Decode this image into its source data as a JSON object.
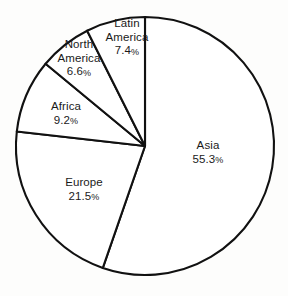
{
  "chart_data": {
    "type": "pie",
    "title": "",
    "subtitle": "",
    "xlabel": "",
    "ylabel": "",
    "legend": "none",
    "grid": false,
    "units": "percent",
    "start_angle_deg": 0,
    "direction": "clockwise",
    "categories": [
      "Asia",
      "Europe",
      "Africa",
      "North America",
      "Latin America"
    ],
    "values": [
      55.3,
      21.5,
      9.2,
      6.6,
      7.4
    ],
    "slices": [
      {
        "name": "Asia",
        "label": "Asia",
        "value": 55.3,
        "value_text": "55.3",
        "pct_symbol": "%",
        "start_deg": 0,
        "end_deg": 199.08,
        "label_x": 208,
        "label_y": 153
      },
      {
        "name": "Europe",
        "label": "Europe",
        "value": 21.5,
        "value_text": "21.5",
        "pct_symbol": "%",
        "start_deg": 199.08,
        "end_deg": 276.48,
        "label_x": 84,
        "label_y": 190
      },
      {
        "name": "Africa",
        "label": "Africa",
        "value": 9.2,
        "value_text": "9.2",
        "pct_symbol": "%",
        "start_deg": 276.48,
        "end_deg": 309.6,
        "label_x": 66,
        "label_y": 114
      },
      {
        "name": "North America",
        "label": "North\nAmerica",
        "value": 6.6,
        "value_text": "6.6",
        "pct_symbol": "%",
        "start_deg": 309.6,
        "end_deg": 333.36,
        "label_x": 79,
        "label_y": 59
      },
      {
        "name": "Latin America",
        "label": "Latin\nAmerica",
        "value": 7.4,
        "value_text": "7.4",
        "pct_symbol": "%",
        "start_deg": 333.36,
        "end_deg": 360,
        "label_x": 127,
        "label_y": 38
      }
    ],
    "geometry": {
      "center_x": 145,
      "center_y": 146,
      "radius": 129
    },
    "colors": {
      "slice_fill": "#ffffff",
      "slice_stroke": "#111111",
      "label_text": "#1a1a1a",
      "background": "#fdfdfc"
    }
  }
}
